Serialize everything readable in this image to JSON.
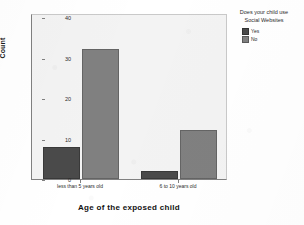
{
  "chart_data": {
    "type": "bar",
    "title": "",
    "subtitle": "",
    "xlabel": "Age of the exposed child",
    "ylabel": "Count",
    "categories": [
      "less than 5 years old",
      "6 to 10 years old"
    ],
    "series": [
      {
        "name": "Yes",
        "values": [
          8,
          2
        ],
        "color": "#4a4a4a"
      },
      {
        "name": "No",
        "values": [
          32,
          12
        ],
        "color": "#808080"
      }
    ],
    "legend": {
      "title": "Does your child use Social Websites",
      "title_line1": "Does your child use",
      "title_line2": "Social Websites",
      "position": "right",
      "entries": [
        "Yes",
        "No"
      ]
    },
    "ylim": [
      0,
      41
    ],
    "yticks": [
      0,
      10,
      20,
      30,
      40
    ],
    "ytick_labels": [
      "0",
      "10",
      "20",
      "30",
      "40"
    ],
    "grid": false,
    "plot_background": "#f3f3f3",
    "axis_color": "#808080"
  }
}
